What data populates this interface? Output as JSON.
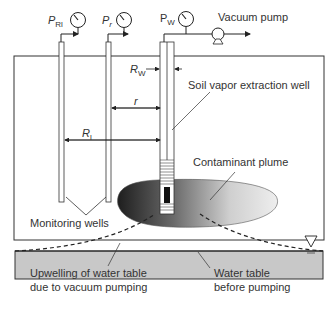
{
  "diagram": {
    "labels": {
      "p_rl_main": "P",
      "p_rl_sub": "Rl",
      "p_r_main": "P",
      "p_r_sub": "r",
      "p_w_main": "P",
      "p_w_sub": "W",
      "vacuum_pump": "Vacuum pump",
      "r_w_main": "R",
      "r_w_sub": "W",
      "r": "r",
      "r_l_main": "R",
      "r_l_sub": "l",
      "soil_vapor_well": "Soil vapor extraction well",
      "contaminant_plume": "Contaminant plume",
      "monitoring_wells": "Monitoring wells",
      "upwelling_line1": "Upwelling of water table",
      "upwelling_line2": "due to vacuum pumping",
      "water_table_line1": "Water table",
      "water_table_line2": "before pumping"
    },
    "colors": {
      "line": "#333333",
      "groundwater": "#c8c8c8",
      "plume_dark": "#2a2a2a",
      "plume_light": "#e6e6e6",
      "screen": "#111111"
    }
  }
}
